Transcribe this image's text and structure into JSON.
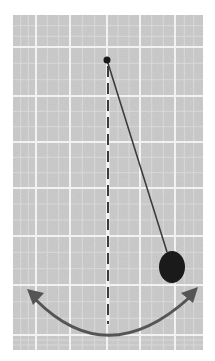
{
  "figure": {
    "elements": {
      "grid": "graph-paper-background",
      "pivot": "pivot-point",
      "string": "pendulum-string",
      "bob": "pendulum-bob",
      "rest_line": "vertical-dashed-equilibrium-line",
      "swing_arrow": "double-headed-curved-arrow"
    }
  },
  "colors": {
    "paper": "#c9c9c9",
    "grid_line": "#f2f2f2",
    "grid_line_minor": "#dcdcdc",
    "ink": "#1a1a1a",
    "string": "#3a3a3a",
    "arrow": "#555555",
    "dash": "#3c3c3c",
    "background": "#ffffff"
  }
}
